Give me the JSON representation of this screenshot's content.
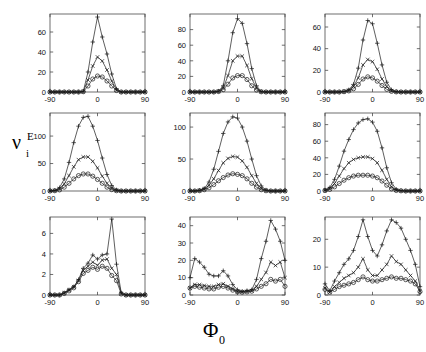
{
  "figure": {
    "ylabel_main": "ν",
    "ylabel_sup": "E",
    "ylabel_sub": "i",
    "xlabel_main": "Φ",
    "xlabel_sub": "0",
    "series_markers": [
      "plus",
      "cross",
      "circle"
    ],
    "line_color": "#1a1a1a",
    "axis_color": "#4a4a4a",
    "background": "#ffffff"
  },
  "chart_data": [
    {
      "type": "line",
      "panel": "r1c1",
      "title": "",
      "xlabel": "Φ_0",
      "ylabel": "ν_i^E",
      "xlim": [
        -90,
        90
      ],
      "ylim": [
        0,
        78
      ],
      "xticks": [
        -90,
        0,
        90
      ],
      "xticklabels": [
        "-90",
        "0",
        "90"
      ],
      "yticks": [
        0,
        20,
        40,
        60
      ],
      "yticklabels": [
        "0",
        "20",
        "40",
        "60"
      ],
      "grid": false,
      "legend": "none",
      "x": [
        -90,
        -81,
        -72,
        -63,
        -54,
        -45,
        -36,
        -27,
        -18,
        -9,
        0,
        9,
        18,
        27,
        36,
        45,
        54,
        63,
        72,
        81,
        90
      ],
      "series": [
        {
          "name": "plus",
          "marker": "plus",
          "values": [
            0,
            0,
            0,
            0,
            0,
            0,
            0,
            0.5,
            20,
            50,
            75,
            55,
            38,
            18,
            3,
            0,
            0,
            0,
            0,
            0,
            0
          ]
        },
        {
          "name": "cross",
          "marker": "cross",
          "values": [
            0,
            0,
            0,
            0,
            0,
            0,
            0,
            0.4,
            12,
            26,
            35,
            31,
            22,
            11,
            2,
            0,
            0,
            0,
            0,
            0,
            0
          ]
        },
        {
          "name": "circle",
          "marker": "circle",
          "values": [
            0,
            0,
            0,
            0,
            0,
            0,
            0,
            0.3,
            6,
            13,
            16,
            15,
            11,
            6,
            1.5,
            0,
            0,
            0,
            0,
            0,
            0
          ]
        }
      ]
    },
    {
      "type": "line",
      "panel": "r1c2",
      "title": "",
      "xlabel": "Φ_0",
      "ylabel": "ν_i^E",
      "xlim": [
        -90,
        90
      ],
      "ylim": [
        0,
        100
      ],
      "xticks": [
        -90,
        0,
        90
      ],
      "xticklabels": [
        "-90",
        "0",
        "90"
      ],
      "yticks": [
        0,
        20,
        40,
        60,
        80
      ],
      "yticklabels": [
        "0",
        "20",
        "40",
        "60",
        "80"
      ],
      "grid": false,
      "legend": "none",
      "x": [
        -90,
        -81,
        -72,
        -63,
        -54,
        -45,
        -36,
        -27,
        -18,
        -9,
        0,
        9,
        18,
        27,
        36,
        45,
        54,
        63,
        72,
        81,
        90
      ],
      "series": [
        {
          "name": "plus",
          "marker": "plus",
          "values": [
            0,
            0,
            0,
            0,
            0,
            0,
            1,
            8,
            40,
            76,
            94,
            88,
            62,
            30,
            8,
            0.5,
            0,
            0,
            0,
            0,
            0
          ]
        },
        {
          "name": "cross",
          "marker": "cross",
          "values": [
            0,
            0,
            0,
            0,
            0,
            0,
            0.8,
            5,
            21,
            40,
            46,
            46,
            34,
            17,
            5,
            0.4,
            0,
            0,
            0,
            0,
            0
          ]
        },
        {
          "name": "circle",
          "marker": "circle",
          "values": [
            0,
            0,
            0,
            0,
            0,
            0,
            0.6,
            3,
            10,
            18,
            21,
            21,
            16,
            8,
            2.5,
            0.3,
            0,
            0,
            0,
            0,
            0
          ]
        }
      ]
    },
    {
      "type": "line",
      "panel": "r1c3",
      "title": "",
      "xlabel": "Φ_0",
      "ylabel": "ν_i^E",
      "xlim": [
        -90,
        90
      ],
      "ylim": [
        0,
        72
      ],
      "xticks": [
        -90,
        0,
        90
      ],
      "xticklabels": [
        "-90",
        "0",
        "90"
      ],
      "yticks": [
        0,
        20,
        40,
        60
      ],
      "yticklabels": [
        "0",
        "20",
        "40",
        "60"
      ],
      "grid": false,
      "legend": "none",
      "x": [
        -90,
        -81,
        -72,
        -63,
        -54,
        -45,
        -36,
        -27,
        -18,
        -9,
        0,
        9,
        18,
        27,
        36,
        45,
        54,
        63,
        72,
        81,
        90
      ],
      "series": [
        {
          "name": "plus",
          "marker": "plus",
          "values": [
            0,
            0,
            0,
            0,
            0.5,
            2,
            7,
            22,
            48,
            66,
            63,
            45,
            25,
            9,
            2,
            0.3,
            0,
            0,
            0,
            0,
            0
          ]
        },
        {
          "name": "cross",
          "marker": "cross",
          "values": [
            0,
            0,
            0,
            0,
            0.4,
            1.5,
            5,
            13,
            25,
            30,
            28,
            21,
            12,
            5,
            1.2,
            0.2,
            0,
            0,
            0,
            0,
            0
          ]
        },
        {
          "name": "circle",
          "marker": "circle",
          "values": [
            0,
            0,
            0,
            0,
            0.3,
            1,
            3,
            7,
            12,
            14,
            13,
            10,
            6,
            2.5,
            0.6,
            0.1,
            0,
            0,
            0,
            0,
            0
          ]
        }
      ]
    },
    {
      "type": "line",
      "panel": "r2c1",
      "title": "",
      "xlabel": "Φ_0",
      "ylabel": "ν_i^E",
      "xlim": [
        -90,
        90
      ],
      "ylim": [
        0,
        142
      ],
      "xticks": [
        -90,
        0,
        90
      ],
      "xticklabels": [
        "-90",
        "0",
        "90"
      ],
      "yticks": [
        0,
        50,
        100
      ],
      "yticklabels": [
        "0",
        "50",
        "100"
      ],
      "grid": false,
      "legend": "none",
      "x": [
        -90,
        -81,
        -72,
        -63,
        -54,
        -45,
        -36,
        -27,
        -18,
        -9,
        0,
        9,
        18,
        27,
        36,
        45,
        54,
        63,
        72,
        81,
        90
      ],
      "series": [
        {
          "name": "plus",
          "marker": "plus",
          "values": [
            0,
            1,
            6,
            22,
            52,
            88,
            118,
            134,
            136,
            118,
            92,
            60,
            30,
            10,
            2,
            0,
            0,
            0,
            0,
            0,
            0
          ]
        },
        {
          "name": "cross",
          "marker": "cross",
          "values": [
            0,
            0.8,
            4,
            13,
            28,
            44,
            57,
            62,
            62,
            54,
            42,
            27,
            14,
            5,
            1,
            0,
            0,
            0,
            0,
            0,
            0
          ]
        },
        {
          "name": "circle",
          "marker": "circle",
          "values": [
            0,
            0.5,
            2,
            7,
            14,
            22,
            28,
            31,
            31,
            27,
            21,
            14,
            7,
            2.5,
            0.5,
            0,
            0,
            0,
            0,
            0,
            0
          ]
        }
      ]
    },
    {
      "type": "line",
      "panel": "r2c2",
      "title": "",
      "xlabel": "Φ_0",
      "ylabel": "ν_i^E",
      "xlim": [
        -90,
        90
      ],
      "ylim": [
        0,
        122
      ],
      "xticks": [
        -90,
        0,
        90
      ],
      "xticklabels": [
        "-90",
        "0",
        "90"
      ],
      "yticks": [
        0,
        50,
        100
      ],
      "yticklabels": [
        "0",
        "50",
        "100"
      ],
      "grid": false,
      "legend": "none",
      "x": [
        -90,
        -81,
        -72,
        -63,
        -54,
        -45,
        -36,
        -27,
        -18,
        -9,
        0,
        9,
        18,
        27,
        36,
        45,
        54,
        63,
        72,
        81,
        90
      ],
      "series": [
        {
          "name": "plus",
          "marker": "plus",
          "values": [
            0,
            0,
            1,
            4,
            14,
            34,
            62,
            90,
            108,
            116,
            114,
            100,
            78,
            50,
            24,
            8,
            1.5,
            0,
            0,
            0,
            0
          ]
        },
        {
          "name": "cross",
          "marker": "cross",
          "values": [
            0,
            0,
            0.8,
            3,
            9,
            19,
            32,
            44,
            51,
            54,
            53,
            47,
            37,
            24,
            12,
            4,
            0.8,
            0,
            0,
            0,
            0
          ]
        },
        {
          "name": "circle",
          "marker": "circle",
          "values": [
            0,
            0,
            0.5,
            2,
            5,
            10,
            16,
            21,
            25,
            27,
            26,
            24,
            19,
            12,
            6,
            2,
            0.4,
            0,
            0,
            0,
            0
          ]
        }
      ]
    },
    {
      "type": "line",
      "panel": "r2c3",
      "title": "",
      "xlabel": "Φ_0",
      "ylabel": "ν_i^E",
      "xlim": [
        -90,
        90
      ],
      "ylim": [
        0,
        94
      ],
      "xticks": [
        -90,
        0,
        90
      ],
      "xticklabels": [
        "-90",
        "0",
        "90"
      ],
      "yticks": [
        0,
        20,
        40,
        60,
        80
      ],
      "yticklabels": [
        "0",
        "20",
        "40",
        "60",
        "80"
      ],
      "grid": false,
      "legend": "none",
      "x": [
        -90,
        -81,
        -72,
        -63,
        -54,
        -45,
        -36,
        -27,
        -18,
        -9,
        0,
        9,
        18,
        27,
        36,
        45,
        54,
        63,
        72,
        81,
        90
      ],
      "series": [
        {
          "name": "plus",
          "marker": "plus",
          "values": [
            1,
            4,
            14,
            30,
            48,
            62,
            74,
            82,
            86,
            87,
            83,
            72,
            52,
            28,
            10,
            2,
            0.5,
            0,
            0,
            0,
            0
          ]
        },
        {
          "name": "cross",
          "marker": "cross",
          "values": [
            0.8,
            3,
            9,
            18,
            27,
            34,
            38,
            40,
            41,
            41,
            39,
            34,
            25,
            14,
            5,
            1,
            0.3,
            0,
            0,
            0,
            0
          ]
        },
        {
          "name": "circle",
          "marker": "circle",
          "values": [
            0.5,
            2,
            5,
            9,
            13,
            16,
            18,
            19,
            19,
            19,
            18,
            16,
            12,
            7,
            2.5,
            0.6,
            0.2,
            0,
            0,
            0,
            0
          ]
        }
      ]
    },
    {
      "type": "line",
      "panel": "r3c1",
      "title": "",
      "xlabel": "Φ_0",
      "ylabel": "ν_i^E",
      "xlim": [
        -90,
        90
      ],
      "ylim": [
        0,
        7.6
      ],
      "xticks": [
        -90,
        0,
        90
      ],
      "xticklabels": [
        "-90",
        "0",
        "90"
      ],
      "yticks": [
        0,
        2,
        4,
        6
      ],
      "yticklabels": [
        "0",
        "2",
        "4",
        "6"
      ],
      "grid": false,
      "legend": "none",
      "x": [
        -90,
        -81,
        -72,
        -63,
        -54,
        -45,
        -36,
        -27,
        -18,
        -9,
        0,
        9,
        18,
        27,
        36,
        45,
        54,
        63,
        72,
        81,
        90
      ],
      "series": [
        {
          "name": "plus",
          "marker": "plus",
          "values": [
            0,
            0,
            0,
            0.2,
            0.5,
            0.8,
            1.5,
            2.6,
            3.1,
            3.9,
            3.5,
            3.9,
            4.0,
            7.4,
            3.0,
            0.2,
            0,
            0,
            0,
            0,
            0
          ]
        },
        {
          "name": "cross",
          "marker": "cross",
          "values": [
            0,
            0,
            0,
            0.2,
            0.5,
            0.8,
            1.4,
            2.4,
            2.8,
            3.2,
            2.9,
            3.4,
            3.5,
            2.6,
            2.0,
            0.15,
            0,
            0,
            0,
            0,
            0
          ]
        },
        {
          "name": "circle",
          "marker": "circle",
          "values": [
            0,
            0,
            0,
            0.15,
            0.4,
            0.7,
            1.3,
            2.1,
            2.4,
            2.7,
            2.5,
            2.8,
            2.6,
            1.9,
            1.4,
            0.1,
            0,
            0,
            0,
            0,
            0
          ]
        }
      ]
    },
    {
      "type": "line",
      "panel": "r3c2",
      "title": "",
      "xlabel": "Φ_0",
      "ylabel": "ν_i^E",
      "xlim": [
        -90,
        90
      ],
      "ylim": [
        0,
        45
      ],
      "xticks": [
        -90,
        0,
        90
      ],
      "xticklabels": [
        "-90",
        "0",
        "90"
      ],
      "yticks": [
        0,
        10,
        20,
        30,
        40
      ],
      "yticklabels": [
        "0",
        "10",
        "20",
        "30",
        "40"
      ],
      "grid": false,
      "legend": "none",
      "x": [
        -90,
        -81,
        -72,
        -63,
        -54,
        -45,
        -36,
        -27,
        -18,
        -9,
        0,
        9,
        18,
        27,
        36,
        45,
        54,
        63,
        72,
        81,
        90
      ],
      "series": [
        {
          "name": "plus",
          "marker": "plus",
          "values": [
            10,
            21,
            19,
            16,
            12,
            11,
            11,
            14,
            11,
            6,
            3,
            2,
            2.5,
            3,
            9,
            21,
            31,
            43,
            38,
            31,
            20
          ]
        },
        {
          "name": "cross",
          "marker": "cross",
          "values": [
            4,
            6,
            6,
            5.5,
            5,
            5,
            6,
            6.5,
            5,
            3.5,
            2,
            1.8,
            2,
            2.5,
            5,
            9,
            13,
            19,
            17,
            19,
            10
          ]
        },
        {
          "name": "circle",
          "marker": "circle",
          "values": [
            4,
            5,
            4.5,
            4,
            3.5,
            3.5,
            4.5,
            5,
            4,
            2.8,
            1.8,
            1.6,
            1.8,
            2.2,
            3.5,
            5,
            6.5,
            9,
            8,
            9,
            5
          ]
        }
      ]
    },
    {
      "type": "line",
      "panel": "r3c3",
      "title": "",
      "xlabel": "Φ_0",
      "ylabel": "ν_i^E",
      "xlim": [
        -90,
        90
      ],
      "ylim": [
        0,
        28
      ],
      "xticks": [
        -90,
        0,
        90
      ],
      "xticklabels": [
        "-90",
        "0",
        "90"
      ],
      "yticks": [
        0,
        10,
        20
      ],
      "yticklabels": [
        "0",
        "10",
        "20"
      ],
      "grid": false,
      "legend": "none",
      "x": [
        -90,
        -81,
        -72,
        -63,
        -54,
        -45,
        -36,
        -27,
        -18,
        -9,
        0,
        9,
        18,
        27,
        36,
        45,
        54,
        63,
        72,
        81,
        90
      ],
      "series": [
        {
          "name": "plus",
          "marker": "plus",
          "values": [
            4,
            1.5,
            5,
            8,
            11,
            13,
            16,
            21,
            27,
            21,
            16,
            14,
            18,
            23,
            27,
            26,
            24,
            20,
            16,
            11,
            3
          ]
        },
        {
          "name": "cross",
          "marker": "cross",
          "values": [
            2.5,
            1,
            3,
            4.5,
            6,
            7,
            8,
            10,
            13,
            9,
            7,
            7,
            9,
            11,
            14,
            12,
            11,
            9,
            7,
            5,
            1.5
          ]
        },
        {
          "name": "circle",
          "marker": "circle",
          "values": [
            2,
            1,
            2,
            3,
            3.5,
            4,
            4.5,
            5.5,
            6.5,
            5.5,
            5,
            5,
            5.5,
            6,
            6.5,
            6,
            6,
            5.5,
            5,
            4,
            1.2
          ]
        }
      ]
    }
  ]
}
